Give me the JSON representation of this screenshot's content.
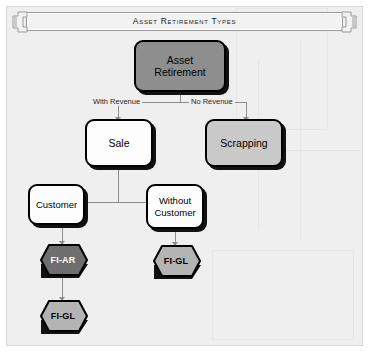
{
  "page": {
    "background": "#ffffff",
    "panel_background": "#efefef",
    "panel_border": "#d8d8d8"
  },
  "banner": {
    "title": "Asset Retirement Types",
    "body_fill": "#f2f2f2",
    "border": "#9a9a9a",
    "cap_left_icon": "ribbon-end-left-icon",
    "cap_right_icon": "ribbon-end-right-icon"
  },
  "colors": {
    "node_dark": "#8e8e8e",
    "node_mid": "#c9c9c9",
    "node_light": "#fdfdfd",
    "hex_dark": "#6e6e6e",
    "hex_mid": "#b4b4b4",
    "outline": "#000000",
    "shadow": "#111111",
    "connector": "#8c8c8c",
    "label_text": "#262626"
  },
  "diagram": {
    "type": "flowchart",
    "nodes": [
      {
        "id": "asset_retirement",
        "label_line1": "Asset",
        "label_line2": "Retirement",
        "shape": "rounded-rect",
        "fill": "#8e8e8e",
        "text_color": "#000000"
      },
      {
        "id": "sale",
        "label": "Sale",
        "shape": "rounded-rect",
        "fill": "#fdfdfd",
        "text_color": "#000000"
      },
      {
        "id": "scrapping",
        "label": "Scrapping",
        "shape": "rounded-rect",
        "fill": "#c9c9c9",
        "text_color": "#000000"
      },
      {
        "id": "customer",
        "label": "Customer",
        "shape": "rounded-rect",
        "fill": "#fdfdfd",
        "text_color": "#000000"
      },
      {
        "id": "without_customer",
        "label_line1": "Without",
        "label_line2": "Customer",
        "shape": "rounded-rect",
        "fill": "#fdfdfd",
        "text_color": "#000000"
      },
      {
        "id": "fi_ar",
        "label": "FI-AR",
        "shape": "hexagon",
        "fill": "#6e6e6e",
        "text_color": "#ffffff"
      },
      {
        "id": "fi_gl_right",
        "label": "FI-GL",
        "shape": "hexagon",
        "fill": "#b4b4b4",
        "text_color": "#000000"
      },
      {
        "id": "fi_gl_bottom",
        "label": "FI-GL",
        "shape": "hexagon",
        "fill": "#b4b4b4",
        "text_color": "#000000"
      }
    ],
    "edge_labels": {
      "with_revenue": "With Revenue",
      "no_revenue": "No Revenue"
    },
    "edges": [
      {
        "from": "asset_retirement",
        "to": "sale",
        "label": "With Revenue"
      },
      {
        "from": "asset_retirement",
        "to": "scrapping",
        "label": "No Revenue"
      },
      {
        "from": "sale",
        "to": "customer",
        "label": ""
      },
      {
        "from": "sale",
        "to": "without_customer",
        "label": ""
      },
      {
        "from": "customer",
        "to": "without_customer",
        "label": ""
      },
      {
        "from": "customer",
        "to": "fi_ar",
        "label": ""
      },
      {
        "from": "without_customer",
        "to": "fi_gl_right",
        "label": ""
      },
      {
        "from": "fi_ar",
        "to": "fi_gl_bottom",
        "label": ""
      }
    ]
  }
}
